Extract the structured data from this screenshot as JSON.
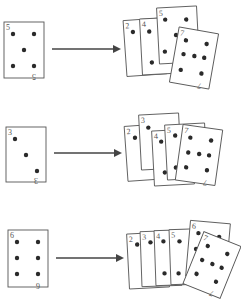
{
  "diagram": {
    "rows": [
      {
        "source_card": {
          "rank": "5",
          "pips": 5
        },
        "arrow": "right-arrow",
        "hand": [
          {
            "rank": "2"
          },
          {
            "rank": "4"
          },
          {
            "rank": "5"
          },
          {
            "rank": "7",
            "pips": 7
          }
        ]
      },
      {
        "source_card": {
          "rank": "3",
          "pips": 3
        },
        "arrow": "right-arrow",
        "hand": [
          {
            "rank": "2"
          },
          {
            "rank": "3"
          },
          {
            "rank": "4"
          },
          {
            "rank": "5"
          },
          {
            "rank": "7",
            "pips": 7
          }
        ]
      },
      {
        "source_card": {
          "rank": "6",
          "pips": 6
        },
        "arrow": "right-arrow",
        "hand": [
          {
            "rank": "2"
          },
          {
            "rank": "3"
          },
          {
            "rank": "4"
          },
          {
            "rank": "5"
          },
          {
            "rank": "6"
          },
          {
            "rank": "7",
            "pips": 7
          }
        ]
      }
    ]
  }
}
